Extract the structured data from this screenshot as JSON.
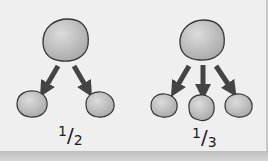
{
  "diagram": {
    "left": {
      "label_numerator": "1",
      "label_denominator": "2",
      "children": 2
    },
    "right": {
      "label_numerator": "1",
      "label_denominator": "3",
      "children": 3
    },
    "colors": {
      "background": "#efefef",
      "cell_fill": "#bdbdbd",
      "cell_outline": "#3a3a3a",
      "arrow": "#4a4a4a"
    }
  }
}
